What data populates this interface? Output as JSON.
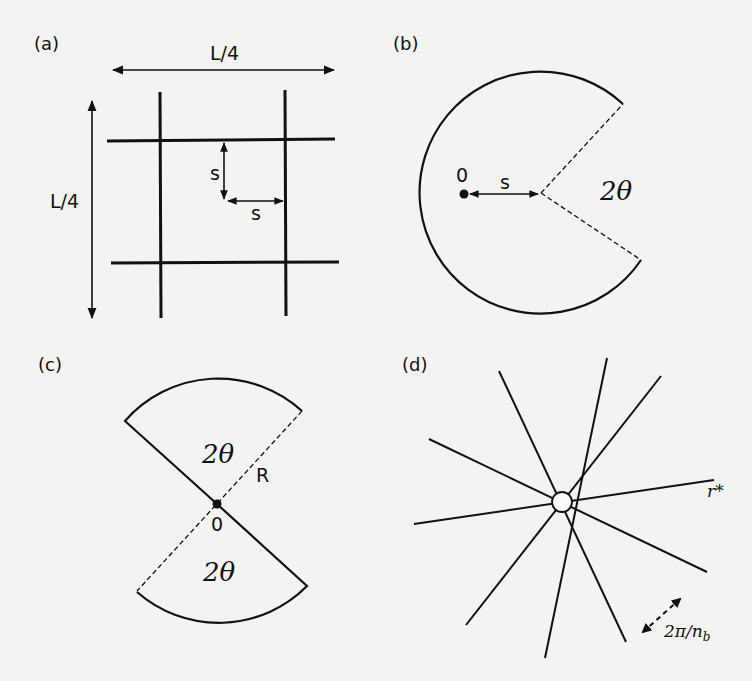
{
  "figure": {
    "background": "#f3f3f1",
    "ink": "#111111",
    "panels": [
      {
        "id": "a",
        "label": "(a)",
        "description": "Square grid of obstacle lines",
        "texts": {
          "width_label": "L/4",
          "height_label": "L/4",
          "spacing_v": "s",
          "spacing_h": "s"
        }
      },
      {
        "id": "b",
        "label": "(b)",
        "description": "Circle with wedge removed of angle 2θ",
        "texts": {
          "origin": "0",
          "offset": "s",
          "angle": "2θ"
        }
      },
      {
        "id": "c",
        "label": "(c)",
        "description": "Two opposing circular sectors (bowtie)",
        "texts": {
          "angle_top": "2θ",
          "radius": "R",
          "origin": "0",
          "angle_bottom": "2θ"
        }
      },
      {
        "id": "d",
        "label": "(d)",
        "description": "Star of radial branches around a small disk",
        "texts": {
          "radius": "r*",
          "angle_main": "2π/n",
          "angle_sub": "b"
        }
      }
    ]
  }
}
